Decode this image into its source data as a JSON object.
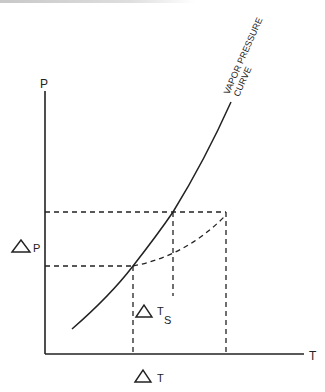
{
  "diagram": {
    "y_axis_label": "P",
    "x_axis_label": "T",
    "curve_label_line1": "VAPOR PRESSURE",
    "curve_label_line2": "CURVE",
    "delta_p_label": "P",
    "delta_t_label": "T",
    "delta_ts_label": "T",
    "delta_ts_subscript": "S",
    "delta_symbol": "triangle"
  }
}
